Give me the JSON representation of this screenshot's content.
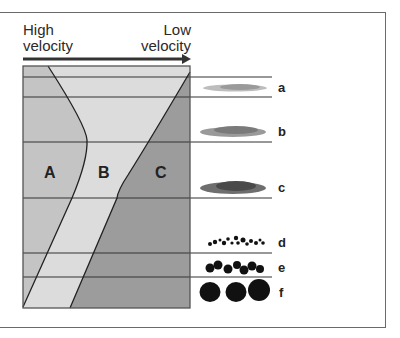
{
  "arrow": {
    "start_label": "High velocity",
    "start_label_line1": "High",
    "start_label_line2": "velocity",
    "end_label_line1": "Low",
    "end_label_line2": "velocity",
    "direction": "right"
  },
  "zones": [
    {
      "id": "A",
      "label": "A",
      "color": "#c4c4c4"
    },
    {
      "id": "B",
      "label": "B",
      "color": "#dcdcdc"
    },
    {
      "id": "C",
      "label": "C",
      "color": "#9c9c9c"
    }
  ],
  "sediments": [
    {
      "label": "a",
      "type": "very fine dots"
    },
    {
      "label": "b",
      "type": "fine dots"
    },
    {
      "label": "c",
      "type": "coarser dots"
    },
    {
      "label": "d",
      "type": "small pebbles"
    },
    {
      "label": "e",
      "type": "medium pebbles"
    },
    {
      "label": "f",
      "type": "large cobbles"
    }
  ],
  "colors": {
    "line": "#333333",
    "frame": "#6a6a6a",
    "zone_a": "#c4c4c4",
    "zone_b": "#dcdcdc",
    "zone_c": "#9c9c9c",
    "sediment": "#111111"
  }
}
